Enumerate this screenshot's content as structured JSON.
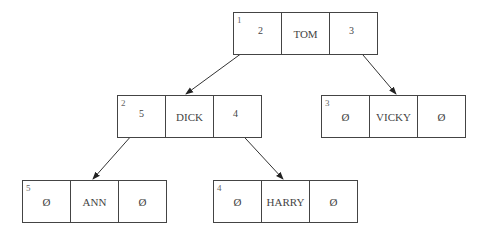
{
  "diagram": {
    "type": "binary-tree-linked-list",
    "null_symbol": "Ø",
    "nodes": [
      {
        "id": "1",
        "left": "2",
        "value": "TOM",
        "right": "3"
      },
      {
        "id": "2",
        "left": "5",
        "value": "DICK",
        "right": "4"
      },
      {
        "id": "3",
        "left": "Ø",
        "value": "VICKY",
        "right": "Ø"
      },
      {
        "id": "5",
        "left": "Ø",
        "value": "ANN",
        "right": "Ø"
      },
      {
        "id": "4",
        "left": "Ø",
        "value": "HARRY",
        "right": "Ø"
      }
    ],
    "edges": [
      {
        "from": "1",
        "to": "2"
      },
      {
        "from": "1",
        "to": "3"
      },
      {
        "from": "2",
        "to": "5"
      },
      {
        "from": "2",
        "to": "4"
      }
    ]
  }
}
